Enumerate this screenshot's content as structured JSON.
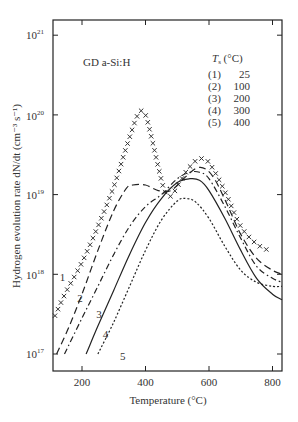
{
  "chart_data": {
    "type": "line",
    "title": "",
    "annotation": "GD a-Si:H",
    "xlabel": "Temperature (°C)",
    "ylabel": "Hydrogen evolution rate dN/dt  (cm⁻³ s⁻¹)",
    "xscale": "linear",
    "yscale": "log",
    "xlim": [
      109,
      830
    ],
    "ylim": [
      1.3e+16,
      1.5e+21
    ],
    "xticks": [
      200,
      400,
      600,
      800
    ],
    "yticks": [
      "10^17",
      "10^18",
      "10^19",
      "10^20",
      "10^21"
    ],
    "grid": false,
    "legend": {
      "title": "Ts (°C)",
      "position": "upper right",
      "entries": [
        {
          "id": "(1)",
          "label": "25"
        },
        {
          "id": "(2)",
          "label": "100"
        },
        {
          "id": "(3)",
          "label": "200"
        },
        {
          "id": "(4)",
          "label": "300"
        },
        {
          "id": "(5)",
          "label": "400"
        }
      ]
    },
    "series": [
      {
        "name": "1 (Ts = 25 °C)",
        "style": "x-markers",
        "x": [
          115,
          150,
          200,
          250,
          300,
          340,
          370,
          385,
          400,
          420,
          440,
          460,
          480,
          500,
          530,
          560,
          580,
          600,
          630,
          660,
          700,
          750,
          800
        ],
        "log10_y": [
          17.48,
          17.78,
          18.15,
          18.6,
          19.1,
          19.6,
          19.95,
          20.05,
          20.0,
          19.7,
          19.35,
          19.05,
          18.98,
          19.1,
          19.3,
          19.43,
          19.45,
          19.4,
          19.2,
          18.95,
          18.6,
          18.38,
          18.28
        ]
      },
      {
        "name": "2 (Ts = 100 °C)",
        "style": "long-dash",
        "x": [
          120,
          160,
          200,
          250,
          300,
          340,
          360,
          400,
          440,
          480,
          520,
          560,
          590,
          620,
          660,
          700,
          750,
          800,
          830
        ],
        "log10_y": [
          17.0,
          17.35,
          17.75,
          18.3,
          18.8,
          19.08,
          19.12,
          19.12,
          19.05,
          19.05,
          19.2,
          19.33,
          19.32,
          19.18,
          18.85,
          18.5,
          18.2,
          18.05,
          18.0
        ]
      },
      {
        "name": "3 (Ts = 200 °C)",
        "style": "dash-dot",
        "x": [
          145,
          200,
          250,
          300,
          350,
          400,
          450,
          500,
          540,
          570,
          600,
          650,
          700,
          750,
          800,
          830
        ],
        "log10_y": [
          17.0,
          17.45,
          17.85,
          18.25,
          18.6,
          18.85,
          19.0,
          19.2,
          19.28,
          19.28,
          19.2,
          18.85,
          18.45,
          18.1,
          17.95,
          17.9
        ]
      },
      {
        "name": "4 (Ts = 300 °C)",
        "style": "solid",
        "x": [
          213,
          250,
          300,
          350,
          400,
          450,
          500,
          540,
          570,
          600,
          650,
          700,
          750,
          800,
          830
        ],
        "log10_y": [
          17.0,
          17.35,
          17.8,
          18.25,
          18.65,
          18.95,
          19.15,
          19.2,
          19.18,
          19.05,
          18.7,
          18.3,
          17.95,
          17.75,
          17.68
        ]
      },
      {
        "name": "5 (Ts = 400 °C)",
        "style": "dotted",
        "x": [
          250,
          300,
          350,
          400,
          450,
          500,
          530,
          560,
          600,
          650,
          700,
          750,
          800,
          830
        ],
        "log10_y": [
          17.0,
          17.4,
          17.85,
          18.3,
          18.68,
          18.92,
          18.95,
          18.9,
          18.7,
          18.35,
          18.05,
          17.9,
          17.85,
          17.85
        ]
      }
    ],
    "curve_labels": [
      {
        "text": "1",
        "x": 130,
        "log10_y": 17.92
      },
      {
        "text": "2",
        "x": 185,
        "log10_y": 17.65
      },
      {
        "text": "3",
        "x": 245,
        "log10_y": 17.45
      },
      {
        "text": "4",
        "x": 265,
        "log10_y": 17.2
      },
      {
        "text": "5",
        "x": 320,
        "log10_y": 16.92
      }
    ]
  }
}
